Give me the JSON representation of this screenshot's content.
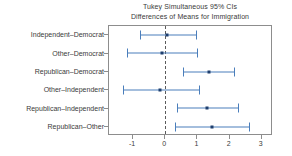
{
  "chart_data": {
    "type": "scatter",
    "title": "Tukey Simultaneous 95% CIs",
    "subtitle": "Differences of Means for Immigration",
    "title_lines": [
      "Tukey Simultaneous 95% CIs",
      "Differences of Means for Immigration"
    ],
    "xlabel": "",
    "ylabel": "",
    "xlim": [
      -1.75,
      3.35
    ],
    "xticks": [
      -1,
      0,
      1,
      2,
      3
    ],
    "xticklabels": [
      "-1",
      "0",
      "1",
      "2",
      "3"
    ],
    "grid": false,
    "legend": "none",
    "reference_line": 0,
    "reference_line_style": "dashed",
    "orientation": "horizontal",
    "categories": [
      "Independent–Democrat",
      "Other–Democrat",
      "Republican–Democrat",
      "Other–Independent",
      "Republican–Independent",
      "Republican–Other"
    ],
    "series": [
      {
        "name": "Difference of Means (95% CI)",
        "color": "#4a7ebb",
        "point_color": "#1f3f6e",
        "points": [
          {
            "category": "Independent–Democrat",
            "value": 0.05,
            "low": -0.8,
            "high": 0.95
          },
          {
            "category": "Other–Democrat",
            "value": -0.1,
            "low": -1.2,
            "high": 1.0
          },
          {
            "category": "Republican–Democrat",
            "value": 1.35,
            "low": 0.55,
            "high": 2.15
          },
          {
            "category": "Other–Independent",
            "value": -0.15,
            "low": -1.3,
            "high": 1.05
          },
          {
            "category": "Republican–Independent",
            "value": 1.3,
            "low": 0.35,
            "high": 2.25
          },
          {
            "category": "Republican–Other",
            "value": 1.45,
            "low": 0.3,
            "high": 2.6
          }
        ]
      }
    ]
  },
  "colors": {
    "interval": "#4a7ebb",
    "point": "#1f3f6e",
    "axis": "#8d8d8d",
    "text": "#3a3a3a",
    "reference": "#5b5b5b",
    "background": "#ffffff"
  }
}
